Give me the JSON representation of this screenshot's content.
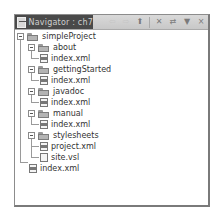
{
  "view": {
    "title": "Navigator : ch7",
    "icon": "navigator-view-icon",
    "toolbar": [
      {
        "name": "back-icon",
        "glyph": "⇦",
        "enabled": false
      },
      {
        "name": "forward-icon",
        "glyph": "⇨",
        "enabled": false
      },
      {
        "name": "up-folder-icon",
        "glyph": "⬆",
        "enabled": true
      },
      {
        "name": "collapse-all-icon",
        "glyph": "✕",
        "enabled": true
      },
      {
        "name": "link-editor-icon",
        "glyph": "⇄",
        "enabled": true
      },
      {
        "name": "view-menu-icon",
        "glyph": "▼",
        "enabled": true
      },
      {
        "name": "close-icon",
        "glyph": "×",
        "enabled": true
      }
    ]
  },
  "tree": {
    "root": "simpleProject",
    "nodes": [
      {
        "label": "simpleProject",
        "type": "project",
        "depth": 0,
        "expanded": true
      },
      {
        "label": "about",
        "type": "folder",
        "depth": 1,
        "expanded": true
      },
      {
        "label": "index.xml",
        "type": "xml",
        "depth": 2
      },
      {
        "label": "gettingStarted",
        "type": "folder",
        "depth": 1,
        "expanded": true
      },
      {
        "label": "index.xml",
        "type": "xml",
        "depth": 2
      },
      {
        "label": "javadoc",
        "type": "folder",
        "depth": 1,
        "expanded": true
      },
      {
        "label": "index.xml",
        "type": "xml",
        "depth": 2
      },
      {
        "label": "manual",
        "type": "folder",
        "depth": 1,
        "expanded": true
      },
      {
        "label": "index.xml",
        "type": "xml",
        "depth": 2
      },
      {
        "label": "stylesheets",
        "type": "folder",
        "depth": 1,
        "expanded": true
      },
      {
        "label": "project.xml",
        "type": "xml",
        "depth": 2
      },
      {
        "label": "site.vsl",
        "type": "file",
        "depth": 2
      },
      {
        "label": "index.xml",
        "type": "xml",
        "depth": 1
      }
    ]
  }
}
